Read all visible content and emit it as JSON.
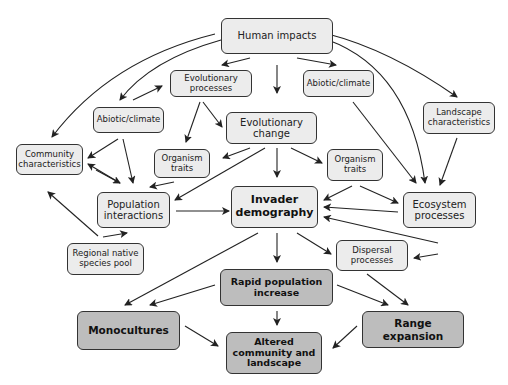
{
  "diagram": {
    "colors": {
      "light_fill": "#ececec",
      "dark_fill": "#bdbdbd",
      "stroke": "#333333"
    },
    "nodes": {
      "human_impacts": "Human impacts",
      "evolutionary_processes": "Evolutionary processes",
      "abiotic_climate_left": "Abiotic/climate",
      "abiotic_climate_right": "Abiotic/climate",
      "landscape_characteristics": "Landscape characteristics",
      "evolutionary_change": "Evolutionary change",
      "community_characteristics": "Community characteristics",
      "organism_traits_left": "Organism traits",
      "organism_traits_right": "Organism traits",
      "population_interactions": "Population interactions",
      "invader_demography": "Invader demography",
      "ecosystem_processes": "Ecosystem processes",
      "regional_native_species_pool": "Regional native species pool",
      "dispersal_processes": "Dispersal processes",
      "rapid_population_increase": "Rapid population increase",
      "monocultures": "Monocultures",
      "range_expansion": "Range expansion",
      "altered_community_and_landscape": "Altered community and landscape"
    }
  }
}
